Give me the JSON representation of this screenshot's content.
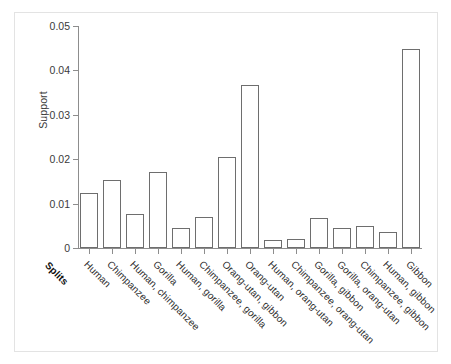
{
  "chart_data": {
    "type": "bar",
    "title": "",
    "xlabel": "Splits",
    "ylabel": "Support",
    "ylim": [
      0,
      0.05
    ],
    "yticks": [
      "0",
      "0.01",
      "0.02",
      "0.03",
      "0.04",
      "0.05"
    ],
    "ytick_values": [
      0,
      0.01,
      0.02,
      0.03,
      0.04,
      0.05
    ],
    "grid": false,
    "legend": "none",
    "bar_face_color": "#ffffff",
    "bar_edge_color": "#6e6e6e",
    "axis_color": "#8d8d8d",
    "categories": [
      "Human",
      "Chimpanzee",
      "Human, chimpanzee",
      "Gorilla",
      "Human, gorilla",
      "Chimpanzee, gorilla",
      "Orang-utan, gibbon",
      "Orang-utan",
      "Human, orang-utan",
      "Chimpanzee, orang-utan",
      "Gorilla, gibbon",
      "Gorilla, orang-utan",
      "Chimpanzee, gibbon",
      "Human, gibbon",
      "Gibbon"
    ],
    "values": [
      0.0123,
      0.0154,
      0.0077,
      0.0172,
      0.0045,
      0.007,
      0.0206,
      0.0368,
      0.0018,
      0.002,
      0.0068,
      0.0045,
      0.005,
      0.0037,
      0.0448
    ]
  },
  "axis": {
    "y_title": "Support",
    "x_corner_label": "Splits"
  }
}
